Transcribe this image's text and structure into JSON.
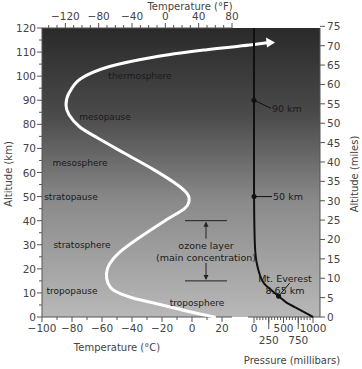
{
  "chart_data": {
    "type": "line",
    "title": "",
    "xlabel": "Temperature (°C)",
    "xlabel_top": "Temperature (°F)",
    "ylabel": "Altitude (km)",
    "ylabel_right": "Altitude (miles)",
    "xlabel_pressure": "Pressure (millibars)",
    "xlim_celsius": [
      -100,
      20
    ],
    "xlim_fahrenheit_ticks": [
      -120,
      -80,
      -40,
      0,
      40,
      80
    ],
    "ylim_km": [
      0,
      120
    ],
    "ylim_miles": [
      0,
      75
    ],
    "x_ticks_celsius": [
      "-100",
      "-80",
      "-60",
      "-40",
      "-20",
      "0",
      "20"
    ],
    "x_ticks_fahrenheit": [
      "-120",
      "-80",
      "-40",
      "0",
      "40",
      "80"
    ],
    "y_ticks_km": [
      "0",
      "10",
      "20",
      "30",
      "40",
      "50",
      "60",
      "70",
      "80",
      "90",
      "100",
      "110",
      "120"
    ],
    "y_ticks_miles": [
      "0",
      "5",
      "10",
      "15",
      "20",
      "25",
      "30",
      "35",
      "40",
      "45",
      "50",
      "55",
      "60",
      "65",
      "70",
      "75"
    ],
    "pressure_ticks_top_row": [
      "0",
      "500",
      "1000"
    ],
    "pressure_ticks_bottom_row": [
      "250",
      "750"
    ],
    "pressure_xlim": [
      0,
      1000
    ],
    "series": [
      {
        "name": "temperature",
        "color": "#ffffff",
        "points_celsius_km": [
          [
            15,
            0
          ],
          [
            0,
            2
          ],
          [
            -20,
            5
          ],
          [
            -40,
            8
          ],
          [
            -52,
            11
          ],
          [
            -56,
            14
          ],
          [
            -57,
            18
          ],
          [
            -55,
            22
          ],
          [
            -48,
            27
          ],
          [
            -35,
            33
          ],
          [
            -18,
            40
          ],
          [
            -5,
            45
          ],
          [
            -2,
            48
          ],
          [
            -3,
            51
          ],
          [
            -10,
            55
          ],
          [
            -25,
            61
          ],
          [
            -45,
            68
          ],
          [
            -62,
            74
          ],
          [
            -75,
            79
          ],
          [
            -82,
            84
          ],
          [
            -84,
            88
          ],
          [
            -82,
            93
          ],
          [
            -74,
            99
          ],
          [
            -55,
            104
          ],
          [
            -25,
            108
          ],
          [
            10,
            111
          ],
          [
            40,
            113
          ],
          [
            52,
            114
          ]
        ],
        "arrow_at_end": true
      },
      {
        "name": "pressure",
        "color": "#111111",
        "points_mb_km": [
          [
            1000,
            0
          ],
          [
            850,
            2
          ],
          [
            700,
            4
          ],
          [
            550,
            6
          ],
          [
            450,
            8
          ],
          [
            350,
            10
          ],
          [
            250,
            12
          ],
          [
            170,
            14
          ],
          [
            120,
            16
          ],
          [
            80,
            19
          ],
          [
            50,
            22
          ],
          [
            30,
            25
          ],
          [
            15,
            30
          ],
          [
            5,
            40
          ],
          [
            1,
            50
          ],
          [
            0,
            70
          ],
          [
            0,
            120
          ]
        ]
      }
    ],
    "markers": [
      {
        "label": "90 km",
        "altitude_km": 90
      },
      {
        "label": "50 km",
        "altitude_km": 50
      },
      {
        "label_line1": "Mt. Everest",
        "label_line2": "8.65 km",
        "altitude_km": 8.65
      }
    ],
    "region_labels": [
      {
        "text": "thermosphere",
        "altitude_km": 100
      },
      {
        "text": "mesopause",
        "altitude_km": 83
      },
      {
        "text": "mesosphere",
        "altitude_km": 64
      },
      {
        "text": "stratopause",
        "altitude_km": 50
      },
      {
        "text": "stratosphere",
        "altitude_km": 30
      },
      {
        "text": "tropopause",
        "altitude_km": 11
      },
      {
        "text": "troposphere",
        "altitude_km": 6
      }
    ],
    "ozone_layer": {
      "line1": "ozone layer",
      "line2": "(main concentration)",
      "range_km": [
        15,
        40
      ]
    }
  }
}
